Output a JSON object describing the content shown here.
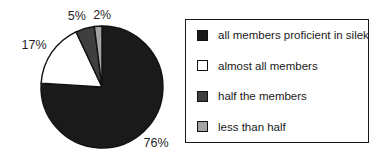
{
  "figure": {
    "background": "#ffffff",
    "outline_color": "#111111",
    "text_color": "#1f1f1f"
  },
  "chart_data": {
    "type": "pie",
    "title": "",
    "start_angle_deg": 0,
    "direction": "clockwise",
    "legend_position": "right",
    "grid": false,
    "slices": [
      {
        "label": "all members proficient in silek",
        "value": 76,
        "pct_label": "76%",
        "color": "#1a1a1a",
        "label_dx": 2,
        "label_dy": 1
      },
      {
        "label": "almost all members",
        "value": 17,
        "pct_label": "17%",
        "color": "#ffffff",
        "label_dx": -5,
        "label_dy": 1
      },
      {
        "label": "half the members",
        "value": 5,
        "pct_label": "5%",
        "color": "#3f3f3f",
        "label_dx": -4,
        "label_dy": 3
      },
      {
        "label": "less than half",
        "value": 2,
        "pct_label": "2%",
        "color": "#a3a3a3",
        "label_dx": 5,
        "label_dy": 5
      }
    ]
  }
}
